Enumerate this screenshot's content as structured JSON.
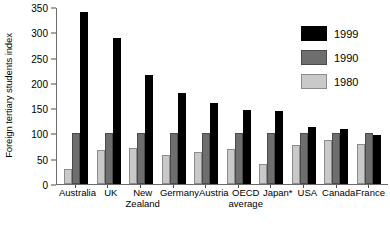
{
  "chart_data": {
    "type": "bar",
    "title": "",
    "xlabel": "",
    "ylabel": "Foreign tertiary students index",
    "ylim": [
      0,
      350
    ],
    "yticks": [
      0,
      50,
      100,
      150,
      200,
      250,
      300,
      350
    ],
    "grid": false,
    "legend_position": "top-right",
    "categories": [
      "Australia",
      "UK",
      "New Zealand",
      "Germany",
      "Austria",
      "OECD average",
      "Japan*",
      "USA",
      "Canada",
      "France"
    ],
    "category_lines": [
      [
        "Australia",
        ""
      ],
      [
        "UK",
        ""
      ],
      [
        "New",
        "Zealand"
      ],
      [
        "Germany",
        ""
      ],
      [
        "Austria",
        ""
      ],
      [
        "OECD",
        "average"
      ],
      [
        "Japan*",
        ""
      ],
      [
        "USA",
        ""
      ],
      [
        "Canada",
        ""
      ],
      [
        "France",
        ""
      ]
    ],
    "series": [
      {
        "name": "1999",
        "color": "#000000",
        "values": [
          341,
          288,
          215,
          180,
          160,
          146,
          145,
          113,
          108,
          97
        ]
      },
      {
        "name": "1990",
        "color": "#6e6e6e",
        "values": [
          100,
          100,
          100,
          100,
          100,
          100,
          100,
          100,
          100,
          100
        ]
      },
      {
        "name": "1980",
        "color": "#c9c9c9",
        "values": [
          30,
          68,
          72,
          58,
          63,
          70,
          40,
          78,
          88,
          80
        ]
      }
    ],
    "bar_order": [
      "1980",
      "1990",
      "1999"
    ]
  },
  "legend": {
    "items": [
      {
        "label": "1999",
        "color": "#000000"
      },
      {
        "label": "1990",
        "color": "#6e6e6e"
      },
      {
        "label": "1980",
        "color": "#c9c9c9"
      }
    ]
  }
}
